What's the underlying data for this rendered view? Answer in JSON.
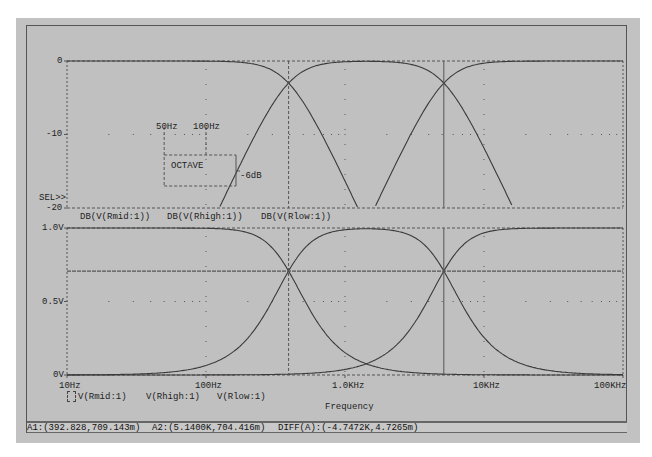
{
  "window": {
    "type": "PSpice Probe waveform window"
  },
  "top_plot": {
    "y_ticks": [
      {
        "label": "0",
        "value": 0
      },
      {
        "label": "-10",
        "value": -10
      },
      {
        "label": "-20",
        "value": -20
      }
    ],
    "sel_marker": "SEL>>",
    "legend": [
      "DB(V(Rmid:1))",
      "DB(V(Rhigh:1))",
      "DB(V(Rlow:1))"
    ],
    "annotations": {
      "f1": "50Hz",
      "f2": "100Hz",
      "box_label": "OCTAVE",
      "slope_label": "-6dB"
    }
  },
  "bottom_plot": {
    "y_ticks": [
      {
        "label": "1.0V",
        "value": 1.0
      },
      {
        "label": "0.5V",
        "value": 0.5
      },
      {
        "label": "0V",
        "value": 0
      }
    ],
    "legend": [
      "V(Rmid:1)",
      "V(Rhigh:1)",
      "V(Rlow:1)"
    ]
  },
  "x_axis": {
    "ticks": [
      "10Hz",
      "100Hz",
      "1.0KHz",
      "10KHz",
      "100KHz"
    ],
    "label": "Frequency"
  },
  "status": {
    "a1": "A1:(392.828,709.143m)",
    "a2": "A2:(5.1400K,704.416m)",
    "diff": "DIFF(A):(-4.7472K,4.7265m)"
  },
  "colors": {
    "background": "#c0c0c0",
    "trace": "#3a3a3a",
    "grid": "#555555"
  },
  "chart_data": [
    {
      "type": "line",
      "title": "",
      "xlabel": "Frequency",
      "ylabel": "dB",
      "xscale": "log",
      "xlim": [
        10,
        100000
      ],
      "ylim": [
        -20,
        0
      ],
      "x": [
        10,
        20,
        50,
        100,
        200,
        392.8,
        1000,
        1420,
        2000,
        5140,
        10000,
        20000,
        50000,
        100000
      ],
      "series": [
        {
          "name": "DB(V(Rlow:1))",
          "values": [
            0,
            0,
            -0.1,
            -0.5,
            -1.3,
            -3.0,
            -9.0,
            -11.6,
            -14.7,
            -20,
            -25,
            -31,
            -39,
            -45
          ]
        },
        {
          "name": "DB(V(Rmid:1))",
          "values": [
            -45,
            -33,
            -17.5,
            -10.5,
            -6.0,
            -3.0,
            -0.5,
            0,
            -0.5,
            -3.0,
            -6.5,
            -11,
            -18,
            -24
          ]
        },
        {
          "name": "DB(V(Rhigh:1))",
          "values": [
            -70,
            -60,
            -45,
            -33,
            -25,
            -20,
            -14.7,
            -11.6,
            -9.0,
            -3.0,
            -1.0,
            -0.3,
            0,
            0
          ]
        }
      ],
      "cursors": {
        "A1": {
          "x": 392.828
        },
        "A2": {
          "x": 5140
        }
      },
      "annotations": [
        "50Hz",
        "100Hz",
        "OCTAVE",
        "-6dB",
        "SEL>>"
      ],
      "grid": "dotted"
    },
    {
      "type": "line",
      "xlabel": "Frequency",
      "ylabel": "V",
      "xscale": "log",
      "xlim": [
        10,
        100000
      ],
      "ylim": [
        0,
        1.0
      ],
      "x": [
        10,
        20,
        50,
        100,
        200,
        392.8,
        1000,
        1420,
        2000,
        5140,
        10000,
        20000,
        50000,
        100000
      ],
      "series": [
        {
          "name": "V(Rlow:1)",
          "values": [
            1.0,
            1.0,
            0.99,
            0.95,
            0.86,
            0.709,
            0.35,
            0.26,
            0.18,
            0.07,
            0.03,
            0.015,
            0.005,
            0.0
          ]
        },
        {
          "name": "V(Rmid:1)",
          "values": [
            0.02,
            0.05,
            0.13,
            0.25,
            0.48,
            0.709,
            0.94,
            1.0,
            0.95,
            0.704,
            0.47,
            0.28,
            0.12,
            0.06
          ]
        },
        {
          "name": "V(Rhigh:1)",
          "values": [
            0.0,
            0.0,
            0.005,
            0.02,
            0.05,
            0.08,
            0.18,
            0.26,
            0.36,
            0.704,
            0.89,
            0.97,
            0.995,
            1.0
          ]
        }
      ],
      "reference_line": 0.707,
      "cursors": {
        "A1": {
          "x": 392.828,
          "y": 0.709143
        },
        "A2": {
          "x": 5140,
          "y": 0.704416
        }
      },
      "grid": "dotted"
    }
  ]
}
